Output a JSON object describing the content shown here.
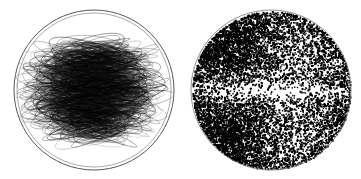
{
  "figure": {
    "width": 361,
    "height": 179,
    "background": "#ffffff",
    "panels": [
      {
        "id": "trajectories",
        "kind": "orbit-trajectories",
        "center": [
          94,
          90
        ],
        "radius": 80,
        "outline_color": "#555555",
        "stroke_color": "#000000",
        "ellipse_count": 900,
        "seed": 7,
        "description": "Overlapping elliptical trajectories filling a sphere, densest toward the centre"
      },
      {
        "id": "point-scatter",
        "kind": "point-scatter",
        "center": [
          271,
          90
        ],
        "radius": 80,
        "outline_color": "#777777",
        "point_color": "#000000",
        "point_count": 9000,
        "seed": 11,
        "description": "Scattered points in a sphere, dense in upper-left and lower-left lobes, sparse horizontal band through the equator"
      }
    ]
  }
}
